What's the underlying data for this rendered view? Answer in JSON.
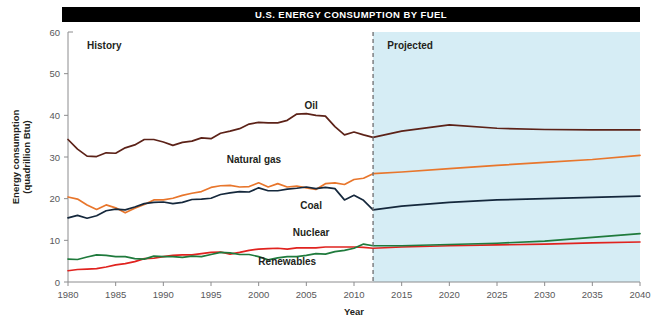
{
  "title": "U.S. ENERGY CONSUMPTION BY FUEL",
  "region_labels": {
    "history": "History",
    "projected": "Projected"
  },
  "colors": {
    "title_bar_bg": "#000000",
    "title_bar_text": "#FFFFFF",
    "projected_bg": "#D6EDF5",
    "divider": "#6E6E70",
    "axis": "#8C8C8E",
    "tick_text": "#58585A",
    "oil": "#5C2218",
    "natural_gas": "#E8762C",
    "coal": "#15283C",
    "nuclear": "#E0231F",
    "renewables": "#1F7A3C"
  },
  "chart_data": {
    "type": "line",
    "title": "U.S. ENERGY CONSUMPTION BY FUEL",
    "xlabel": "Year",
    "ylabel": "Energy consumption (quadrillion Btu)",
    "xlim": [
      1980,
      2040
    ],
    "ylim": [
      0,
      60
    ],
    "grid": false,
    "legend": "inline-labels",
    "xticks": [
      1980,
      1985,
      1990,
      1995,
      2000,
      2005,
      2010,
      2015,
      2020,
      2025,
      2030,
      2035,
      2040
    ],
    "yticks": [
      0,
      10,
      20,
      30,
      40,
      50,
      60
    ],
    "history_projection_split": 2012,
    "annotations": [
      {
        "text": "History",
        "x": 1982,
        "y": 56
      },
      {
        "text": "Projected",
        "x": 2013.5,
        "y": 56
      },
      {
        "text": "Oil",
        "x": 2005.5,
        "y": 41.5
      },
      {
        "text": "Natural gas",
        "x": 1999.5,
        "y": 28.5
      },
      {
        "text": "Coal",
        "x": 2005.5,
        "y": 17.5
      },
      {
        "text": "Nuclear",
        "x": 2005.5,
        "y": 11.0
      },
      {
        "text": "Renewables",
        "x": 2003.0,
        "y": 4.2
      }
    ],
    "x": [
      1980,
      1981,
      1982,
      1983,
      1984,
      1985,
      1986,
      1987,
      1988,
      1989,
      1990,
      1991,
      1992,
      1993,
      1994,
      1995,
      1996,
      1997,
      1998,
      1999,
      2000,
      2001,
      2002,
      2003,
      2004,
      2005,
      2006,
      2007,
      2008,
      2009,
      2010,
      2011,
      2012,
      2015,
      2020,
      2025,
      2030,
      2035,
      2040
    ],
    "series": [
      {
        "name": "Oil",
        "color": "#5C2218",
        "values": [
          34.2,
          31.9,
          30.2,
          30.1,
          31.0,
          30.9,
          32.2,
          32.9,
          34.2,
          34.2,
          33.6,
          32.8,
          33.5,
          33.8,
          34.6,
          34.4,
          35.7,
          36.2,
          36.8,
          37.9,
          38.3,
          38.2,
          38.2,
          38.8,
          40.3,
          40.4,
          40.0,
          39.8,
          37.3,
          35.3,
          36.0,
          35.3,
          34.7,
          36.2,
          37.7,
          36.9,
          36.6,
          36.5,
          36.5
        ]
      },
      {
        "name": "Natural gas",
        "color": "#E8762C",
        "values": [
          20.4,
          19.9,
          18.5,
          17.4,
          18.5,
          17.8,
          16.6,
          17.7,
          18.6,
          19.7,
          19.7,
          20.1,
          20.8,
          21.3,
          21.7,
          22.7,
          23.1,
          23.2,
          22.8,
          22.9,
          23.8,
          22.8,
          23.6,
          22.8,
          23.0,
          22.6,
          22.2,
          23.6,
          23.8,
          23.4,
          24.6,
          24.9,
          26.0,
          26.4,
          27.2,
          28.0,
          28.7,
          29.4,
          30.4
        ]
      },
      {
        "name": "Coal",
        "color": "#15283C",
        "values": [
          15.4,
          16.0,
          15.3,
          15.9,
          17.1,
          17.5,
          17.3,
          18.0,
          18.8,
          19.1,
          19.2,
          18.8,
          19.1,
          19.8,
          19.9,
          20.1,
          21.0,
          21.4,
          21.7,
          21.6,
          22.6,
          21.9,
          21.9,
          22.3,
          22.5,
          22.8,
          22.4,
          22.7,
          22.4,
          19.7,
          20.8,
          19.6,
          17.3,
          18.2,
          19.1,
          19.7,
          20.0,
          20.3,
          20.6
        ]
      },
      {
        "name": "Nuclear",
        "color": "#E0231F",
        "values": [
          2.7,
          3.0,
          3.1,
          3.2,
          3.6,
          4.1,
          4.4,
          4.9,
          5.6,
          5.7,
          6.1,
          6.4,
          6.5,
          6.5,
          6.8,
          7.1,
          7.2,
          6.7,
          7.1,
          7.6,
          7.9,
          8.0,
          8.1,
          7.9,
          8.2,
          8.2,
          8.2,
          8.4,
          8.4,
          8.4,
          8.4,
          8.3,
          8.1,
          8.4,
          8.7,
          8.9,
          9.1,
          9.4,
          9.6
        ]
      },
      {
        "name": "Renewables",
        "color": "#1F7A3C",
        "values": [
          5.5,
          5.4,
          6.0,
          6.5,
          6.4,
          6.1,
          6.1,
          5.6,
          5.5,
          6.2,
          6.1,
          6.1,
          5.9,
          6.2,
          6.1,
          6.6,
          7.1,
          7.0,
          6.6,
          6.6,
          6.1,
          5.3,
          5.8,
          6.1,
          6.1,
          6.4,
          6.8,
          6.7,
          7.3,
          7.6,
          8.1,
          9.1,
          8.7,
          8.7,
          9.0,
          9.3,
          9.8,
          10.7,
          11.6
        ]
      }
    ]
  }
}
